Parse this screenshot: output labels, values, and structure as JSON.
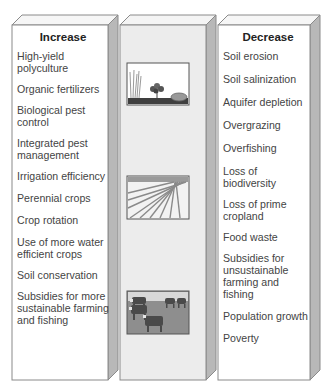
{
  "increase": {
    "title": "Increase",
    "items": [
      "High-yield polyculture",
      "Organic fertilizers",
      "Biological pest control",
      "Integrated pest management",
      "Irrigation efficiency",
      "Perennial crops",
      "Crop rotation",
      "Use of more water efficient crops",
      "Soil conservation",
      "Subsidies for more sustainable farming and fishing"
    ]
  },
  "decrease": {
    "title": "Decrease",
    "items": [
      "Soil erosion",
      "Soil salinization",
      "Aquifer depletion",
      "Overgrazing",
      "Overfishing",
      "Loss of biodiversity",
      "Loss of prime cropland",
      "Food waste",
      "Subsidies for unsustainable farming and fishing",
      "Population growth",
      "Poverty"
    ]
  },
  "images": [
    {
      "name": "polyculture-plants-illustration"
    },
    {
      "name": "plowed-field-rows-illustration"
    },
    {
      "name": "grazing-cattle-illustration"
    }
  ],
  "colors": {
    "panel_face": "#ffffff",
    "middle_face": "#ececec",
    "side_face": "#b8b8b8",
    "top_face": "#f4f4f4",
    "outline": "#8a8a8a",
    "text": "#444444"
  }
}
